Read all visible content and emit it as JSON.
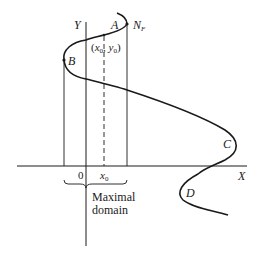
{
  "diagram": {
    "axes": {
      "x_label": "X",
      "y_label": "Y",
      "origin_label": "0"
    },
    "points": {
      "A": "A",
      "B": "B",
      "C": "C",
      "D": "D",
      "N_F": "N",
      "N_F_sub": "F"
    },
    "initial_point": {
      "open": "(",
      "x": "x",
      "x_sub": "0",
      "comma": ", ",
      "y": "y",
      "y_sub": "0",
      "close": ")"
    },
    "x0_label": "x",
    "x0_sub": "0",
    "domain_label_line1": "Maximal",
    "domain_label_line2": "domain",
    "colors": {
      "stroke": "#1a1a1a",
      "background": "#ffffff"
    }
  }
}
